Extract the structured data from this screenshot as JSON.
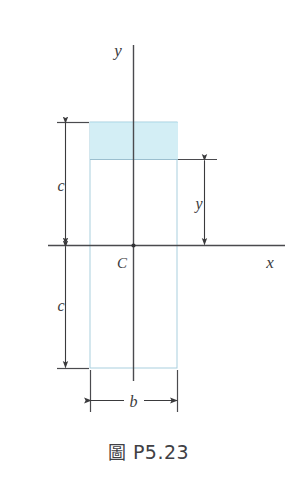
{
  "figure": {
    "caption_symbol": "圖",
    "caption_number": "P5.23",
    "axes": {
      "y_axis_label": "y",
      "x_axis_label": "x"
    },
    "centroid": {
      "label": "C"
    },
    "dimensions": {
      "upper_c_label": "c",
      "lower_c_label": "c",
      "y_distance_label": "y",
      "width_label": "b"
    },
    "colors": {
      "shaded_area_fill": "#d3eef5",
      "outline": "#9fc8da",
      "ink": "#3a3a3c",
      "background": "#ffffff"
    },
    "geometry": {
      "rect_left": 90,
      "rect_right": 177,
      "rect_top": 122,
      "rect_bottom": 368,
      "shaded_band_bottom": 159,
      "x_axis_y": 245,
      "y_axis_x": 133
    }
  }
}
